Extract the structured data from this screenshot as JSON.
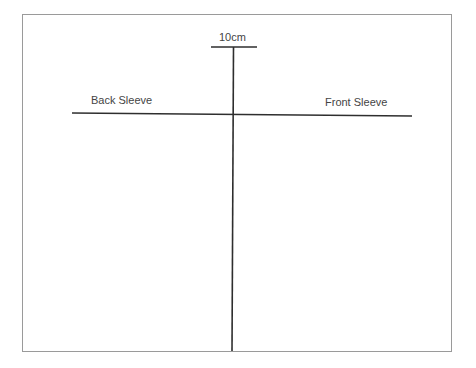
{
  "diagram": {
    "measure_label": "10cm",
    "left_label": "Back Sleeve",
    "right_label": "Front Sleeve",
    "line_color": "#2e2e2e",
    "frame_color": "#9a9a9a"
  }
}
